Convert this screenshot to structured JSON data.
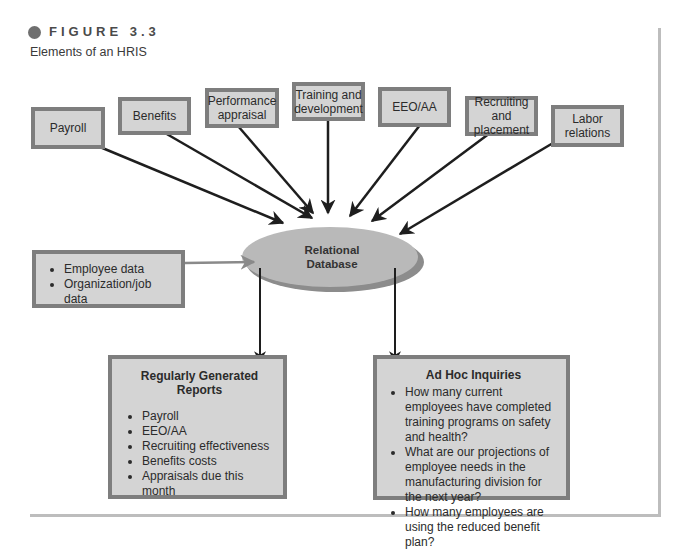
{
  "figure": {
    "label": "FIGURE 3.3",
    "title": "Elements of an HRIS"
  },
  "inputs": [
    {
      "label": "Payroll"
    },
    {
      "label": "Benefits"
    },
    {
      "label": "Performance appraisal"
    },
    {
      "label": "Training and development"
    },
    {
      "label": "EEO/AA"
    },
    {
      "label": "Recruiting and placement"
    },
    {
      "label": "Labor relations"
    }
  ],
  "data_input": {
    "items": [
      "Employee data",
      "Organization/job data"
    ]
  },
  "database": {
    "line1": "Relational",
    "line2": "Database"
  },
  "reports": {
    "title": "Regularly Generated Reports",
    "items": [
      "Payroll",
      "EEO/AA",
      "Recruiting effectiveness",
      "Benefits costs",
      "Appraisals due this month"
    ]
  },
  "inquiries": {
    "title": "Ad Hoc Inquiries",
    "items": [
      "How many current employees have completed training programs on safety and health?",
      "What are our projections of employee needs in the manufacturing division for the next year?",
      "How many employees are using the reduced benefit plan?"
    ]
  },
  "colors": {
    "box_fill": "#d4d4d4",
    "box_border": "#7e7e7e",
    "ellipse_fill": "#b9b9b9",
    "ellipse_shadow": "#8c8c8c",
    "arrow": "#1e1e1e",
    "input_arrow": "#8a8a8a"
  }
}
